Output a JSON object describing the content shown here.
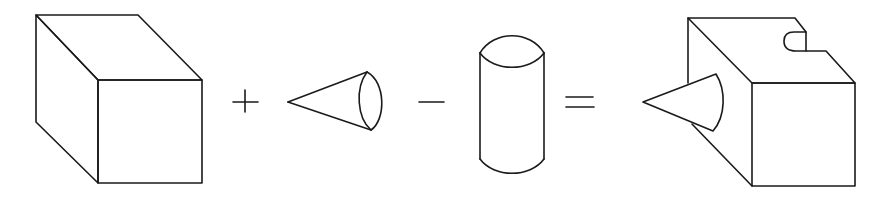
{
  "diagram": {
    "title": "Constructive solid geometry: block + cone - cylinder = result",
    "stroke_color": "#1a1a1a",
    "background_color": "#ffffff",
    "operands": [
      {
        "id": "block",
        "label": "Rectangular block (cube)"
      },
      {
        "id": "cone",
        "label": "Cone"
      },
      {
        "id": "cylinder",
        "label": "Cylinder"
      }
    ],
    "operators": [
      {
        "id": "plus",
        "symbol": "+",
        "meaning": "union"
      },
      {
        "id": "minus",
        "symbol": "−",
        "meaning": "difference"
      },
      {
        "id": "equals",
        "symbol": "=",
        "meaning": "result"
      }
    ],
    "result": {
      "label": "Block with cone attached and cylindrical notch removed"
    }
  }
}
